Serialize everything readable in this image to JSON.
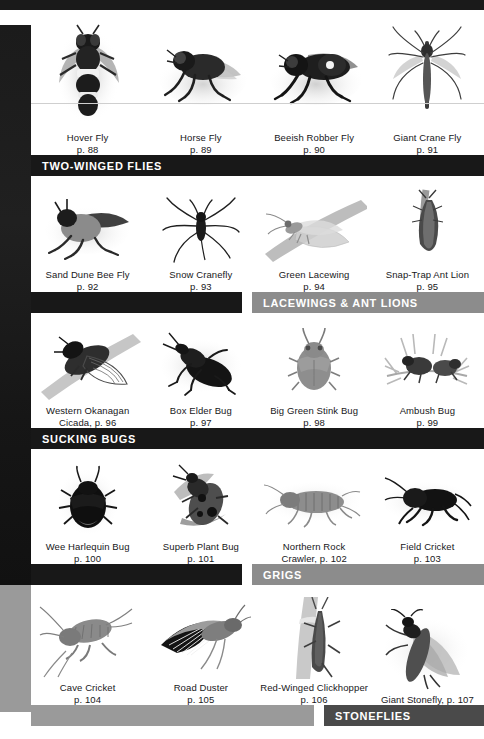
{
  "page": {
    "background": "#ffffff",
    "left_column_color": "#1b1b1b",
    "left_column_lower_color": "#9a9a9a",
    "band_black": "#181818",
    "band_gray": "#8c8c8c",
    "band_dark_gray": "#4a4a4a"
  },
  "rows": [
    {
      "id": "row-flies",
      "plates": [
        {
          "name": "Hover Fly",
          "page": "p. 88",
          "caption": "Hover Fly\np. 88"
        },
        {
          "name": "Horse Fly",
          "page": "p. 89",
          "caption": "Horse Fly\np. 89"
        },
        {
          "name": "Beeish Robber Fly",
          "page": "p. 90",
          "caption": "Beeish Robber Fly\np. 90"
        },
        {
          "name": "Giant Crane Fly",
          "page": "p. 91",
          "caption": "Giant Crane Fly\np. 91"
        }
      ]
    },
    {
      "id": "row-beeflies",
      "plates": [
        {
          "name": "Sand Dune Bee Fly",
          "page": "p. 92",
          "caption": "Sand Dune Bee Fly\np. 92"
        },
        {
          "name": "Snow Cranefly",
          "page": "p. 93",
          "caption": "Snow Cranefly\np. 93"
        },
        {
          "name": "Green Lacewing",
          "page": "p. 94",
          "caption": "Green Lacewing\np. 94"
        },
        {
          "name": "Snap-Trap Ant Lion",
          "page": "p. 95",
          "caption": "Snap-Trap Ant Lion\np. 95"
        }
      ]
    },
    {
      "id": "row-bugs",
      "plates": [
        {
          "name": "Western Okanagan Cicada",
          "page": "p. 96",
          "caption": "Western Okanagan\nCicada, p. 96"
        },
        {
          "name": "Box Elder Bug",
          "page": "p. 97",
          "caption": "Box Elder Bug\np. 97"
        },
        {
          "name": "Big Green Stink Bug",
          "page": "p. 98",
          "caption": "Big Green Stink Bug\np. 98"
        },
        {
          "name": "Ambush Bug",
          "page": "p. 99",
          "caption": "Ambush Bug\np. 99"
        }
      ]
    },
    {
      "id": "row-grigs",
      "plates": [
        {
          "name": "Wee Harlequin Bug",
          "page": "p. 100",
          "caption": "Wee Harlequin Bug\np. 100"
        },
        {
          "name": "Superb Plant Bug",
          "page": "p. 101",
          "caption": "Superb Plant Bug\np. 101"
        },
        {
          "name": "Northern Rock Crawler",
          "page": "p. 102",
          "caption": "Northern Rock\nCrawler, p. 102"
        },
        {
          "name": "Field Cricket",
          "page": "p. 103",
          "caption": "Field Cricket\np. 103"
        }
      ]
    },
    {
      "id": "row-stoneflies",
      "plates": [
        {
          "name": "Cave Cricket",
          "page": "p. 104",
          "caption": "Cave Cricket\np. 104"
        },
        {
          "name": "Road Duster",
          "page": "p. 105",
          "caption": "Road Duster\np. 105"
        },
        {
          "name": "Red-Winged Clickhopper",
          "page": "p. 106",
          "caption": "Red-Winged Clickhopper\np. 106"
        },
        {
          "name": "Giant Stonefly",
          "page": "p. 107",
          "caption": "Giant Stonefly, p. 107"
        }
      ]
    }
  ],
  "bands": [
    {
      "id": "band-two-winged-flies",
      "label": "TWO-WINGED FLIES",
      "style": "full"
    },
    {
      "id": "band-lacewings",
      "label": "LACEWINGS & ANT LIONS",
      "style": "right-gray"
    },
    {
      "id": "band-sucking-bugs",
      "label": "SUCKING BUGS",
      "style": "full"
    },
    {
      "id": "band-grigs",
      "label": "GRIGS",
      "style": "right-gray"
    },
    {
      "id": "band-stoneflies",
      "label": "STONEFLIES",
      "style": "right-dark"
    }
  ]
}
